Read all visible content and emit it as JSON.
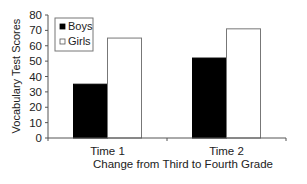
{
  "chart_data": {
    "type": "bar",
    "title": "",
    "xlabel": "Change from Third to Fourth Grade",
    "ylabel": "Vocabulary Test Scores",
    "ylim": [
      0,
      80
    ],
    "yticks": [
      0,
      10,
      20,
      30,
      40,
      50,
      60,
      70,
      80
    ],
    "categories": [
      "Time 1",
      "Time 2"
    ],
    "series": [
      {
        "name": "Boys",
        "color": "#000000",
        "values": [
          35,
          52
        ]
      },
      {
        "name": "Girls",
        "color": "#ffffff",
        "values": [
          65,
          71
        ]
      }
    ],
    "legend": {
      "position": "top-left",
      "entries": [
        "Boys",
        "Girls"
      ]
    },
    "grid": false
  }
}
